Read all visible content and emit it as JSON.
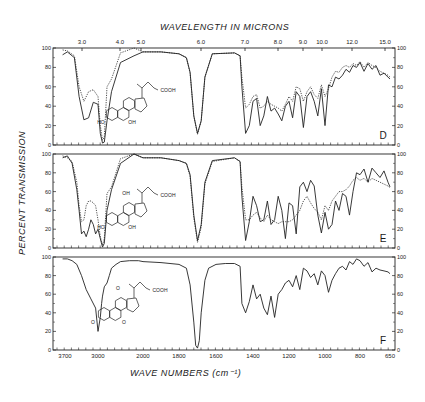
{
  "figure": {
    "top_axis_title": "WAVELENGTH IN MICRONS",
    "bottom_axis_title": "WAVE NUMBERS (cm⁻¹)",
    "y_axis_title": "PERCENT TRANSMISSION"
  },
  "chart_data": {
    "type": "line",
    "xlabel": "WAVE NUMBERS (cm-1)",
    "x2label": "WAVELENGTH IN MICRONS",
    "ylabel": "PERCENT TRANSMISSION",
    "top_ticks": [
      "3.0",
      "4.0",
      "5.0",
      "6.0",
      "7.0",
      "8.0",
      "9.0",
      "10.0",
      "12.0",
      "15.0"
    ],
    "top_tick_x": [
      82,
      120,
      141,
      201,
      245,
      278,
      303,
      322,
      352,
      385
    ],
    "bottom_ticks": [
      "3700",
      "3000",
      "2000",
      "1800",
      "1600",
      "1400",
      "1200",
      "1000",
      "800",
      "650"
    ],
    "bottom_tick_wn": [
      3700,
      3000,
      2000,
      1800,
      1600,
      1400,
      1200,
      1000,
      800,
      650
    ],
    "bottom_tick_x": [
      65,
      98,
      143,
      179,
      216,
      253,
      289,
      325,
      360,
      390
    ],
    "y_ticks": [
      0,
      20,
      40,
      60,
      80,
      100
    ],
    "ylim": [
      0,
      100
    ],
    "grid": false,
    "panels": [
      {
        "label": "D",
        "molecule_substituents": [
          "HO",
          "OH",
          "COOH"
        ],
        "series": [
          {
            "name": "solid",
            "style": "solid",
            "x": [
              3750,
              3650,
              3500,
              3400,
              3300,
              3200,
              3100,
              3000,
              2950,
              2900,
              2860,
              2800,
              2700,
              2500,
              2200,
              2000,
              1900,
              1800,
              1760,
              1740,
              1720,
              1700,
              1680,
              1660,
              1620,
              1500,
              1470,
              1460,
              1440,
              1420,
              1400,
              1380,
              1360,
              1340,
              1320,
              1300,
              1280,
              1260,
              1240,
              1220,
              1200,
              1180,
              1160,
              1140,
              1120,
              1100,
              1080,
              1060,
              1040,
              1020,
              1000,
              980,
              960,
              940,
              920,
              900,
              880,
              860,
              840,
              820,
              800,
              780,
              760,
              740,
              720,
              700,
              680,
              660,
              650
            ],
            "y": [
              93,
              96,
              90,
              50,
              26,
              28,
              44,
              42,
              12,
              2,
              3,
              25,
              55,
              85,
              92,
              96,
              96,
              94,
              90,
              75,
              30,
              12,
              25,
              70,
              94,
              95,
              92,
              60,
              12,
              20,
              45,
              48,
              20,
              30,
              50,
              35,
              38,
              32,
              25,
              40,
              45,
              28,
              55,
              50,
              18,
              50,
              55,
              45,
              30,
              58,
              20,
              62,
              60,
              70,
              68,
              72,
              78,
              75,
              82,
              80,
              85,
              76,
              84,
              78,
              82,
              72,
              74,
              70,
              68
            ]
          },
          {
            "name": "dotted",
            "style": "dotted",
            "x": [
              3750,
              3650,
              3500,
              3400,
              3300,
              3200,
              3100,
              3000,
              2950,
              2900,
              2860,
              2800,
              2700,
              2500,
              2200,
              2000,
              1900,
              1800,
              1760,
              1740,
              1720,
              1700,
              1680,
              1660,
              1620,
              1500,
              1470,
              1460,
              1440,
              1420,
              1400,
              1380,
              1360,
              1340,
              1320,
              1300,
              1280,
              1260,
              1240,
              1220,
              1200,
              1180,
              1160,
              1140,
              1120,
              1100,
              1080,
              1060,
              1040,
              1020,
              1000,
              980,
              960,
              940,
              920,
              900,
              880,
              860,
              840,
              820,
              800,
              780,
              760,
              740,
              720,
              700,
              680,
              660,
              650
            ],
            "y": [
              98,
              97,
              92,
              60,
              45,
              55,
              57,
              50,
              20,
              5,
              8,
              60,
              68,
              95,
              100,
              96,
              96,
              94,
              90,
              74,
              30,
              11,
              25,
              70,
              94,
              95,
              92,
              70,
              38,
              42,
              50,
              52,
              38,
              40,
              45,
              42,
              40,
              38,
              35,
              42,
              50,
              45,
              60,
              58,
              45,
              55,
              60,
              52,
              48,
              62,
              50,
              58,
              70,
              76,
              75,
              80,
              82,
              80,
              84,
              82,
              86,
              80,
              85,
              82,
              80,
              76,
              74,
              72,
              70
            ]
          }
        ]
      },
      {
        "label": "E",
        "molecule_substituents": [
          "HO",
          "OH",
          "OH",
          "COOH"
        ],
        "series": [
          {
            "name": "solid",
            "style": "solid",
            "x": [
              3750,
              3650,
              3550,
              3450,
              3400,
              3350,
              3300,
              3250,
              3200,
              3150,
              3100,
              3050,
              3000,
              2950,
              2900,
              2860,
              2800,
              2700,
              2500,
              2200,
              2000,
              1900,
              1800,
              1760,
              1740,
              1720,
              1700,
              1680,
              1660,
              1620,
              1500,
              1470,
              1460,
              1440,
              1420,
              1400,
              1380,
              1360,
              1340,
              1320,
              1300,
              1280,
              1260,
              1240,
              1220,
              1200,
              1180,
              1160,
              1140,
              1120,
              1100,
              1080,
              1060,
              1040,
              1020,
              1000,
              980,
              960,
              940,
              920,
              900,
              880,
              860,
              840,
              820,
              800,
              780,
              760,
              740,
              720,
              700,
              680,
              660,
              650
            ],
            "y": [
              96,
              98,
              90,
              62,
              40,
              15,
              18,
              12,
              20,
              30,
              25,
              15,
              20,
              10,
              1,
              5,
              40,
              62,
              90,
              100,
              96,
              96,
              93,
              90,
              78,
              35,
              8,
              25,
              70,
              93,
              96,
              92,
              55,
              8,
              28,
              55,
              45,
              28,
              30,
              50,
              25,
              30,
              55,
              40,
              10,
              48,
              45,
              15,
              65,
              70,
              60,
              72,
              66,
              35,
              16,
              38,
              20,
              25,
              50,
              40,
              58,
              55,
              35,
              60,
              80,
              78,
              84,
              70,
              85,
              80,
              75,
              82,
              70,
              65
            ]
          },
          {
            "name": "dotted",
            "style": "dotted",
            "x": [
              3750,
              3650,
              3550,
              3450,
              3400,
              3350,
              3300,
              3250,
              3200,
              3150,
              3100,
              3050,
              3000,
              2950,
              2900,
              2860,
              2800,
              2700,
              2500,
              2200,
              2000,
              1900,
              1800,
              1760,
              1740,
              1720,
              1700,
              1680,
              1660,
              1620,
              1500,
              1470,
              1460,
              1440,
              1420,
              1400,
              1380,
              1360,
              1340,
              1320,
              1300,
              1280,
              1260,
              1240,
              1220,
              1200,
              1180,
              1160,
              1140,
              1120,
              1100,
              1080,
              1060,
              1040,
              1020,
              1000,
              980,
              960,
              940,
              920,
              900,
              880,
              860,
              840,
              820,
              800,
              780,
              760,
              740,
              720,
              700,
              680,
              660,
              650
            ],
            "y": [
              98,
              96,
              92,
              70,
              45,
              28,
              30,
              45,
              50,
              50,
              48,
              45,
              30,
              12,
              3,
              10,
              58,
              65,
              95,
              100,
              96,
              96,
              93,
              90,
              76,
              32,
              6,
              22,
              68,
              92,
              96,
              92,
              65,
              30,
              30,
              35,
              38,
              32,
              28,
              35,
              30,
              28,
              26,
              28,
              28,
              28,
              30,
              35,
              40,
              50,
              55,
              48,
              42,
              38,
              30,
              45,
              40,
              50,
              55,
              60,
              60,
              62,
              66,
              72,
              75,
              72,
              74,
              70,
              74,
              72,
              70,
              68,
              66,
              64
            ]
          }
        ]
      },
      {
        "label": "F",
        "molecule_substituents": [
          "O",
          "O",
          "O",
          "COOH"
        ],
        "series": [
          {
            "name": "solid",
            "style": "solid",
            "x": [
              3750,
              3650,
              3550,
              3450,
              3350,
              3250,
              3150,
              3050,
              3000,
              2950,
              2920,
              2900,
              2860,
              2800,
              2750,
              2700,
              2600,
              2500,
              2300,
              2100,
              2000,
              1900,
              1800,
              1760,
              1740,
              1720,
              1710,
              1700,
              1690,
              1680,
              1660,
              1640,
              1600,
              1550,
              1500,
              1470,
              1460,
              1440,
              1420,
              1400,
              1380,
              1360,
              1340,
              1320,
              1300,
              1280,
              1260,
              1240,
              1220,
              1200,
              1180,
              1160,
              1140,
              1120,
              1100,
              1080,
              1060,
              1040,
              1020,
              1000,
              980,
              960,
              940,
              920,
              900,
              880,
              860,
              840,
              820,
              800,
              780,
              760,
              740,
              720,
              700,
              680,
              660,
              650
            ],
            "y": [
              98,
              98,
              96,
              92,
              80,
              65,
              55,
              45,
              20,
              35,
              50,
              58,
              68,
              72,
              80,
              88,
              92,
              95,
              96,
              96,
              95,
              94,
              92,
              88,
              70,
              30,
              5,
              2,
              10,
              40,
              75,
              88,
              92,
              93,
              93,
              90,
              50,
              40,
              52,
              70,
              55,
              60,
              45,
              38,
              58,
              35,
              60,
              65,
              72,
              75,
              68,
              80,
              65,
              88,
              85,
              78,
              82,
              70,
              85,
              80,
              62,
              75,
              82,
              88,
              90,
              86,
              95,
              92,
              98,
              96,
              90,
              94,
              84,
              88,
              86,
              85,
              84,
              82
            ]
          }
        ]
      }
    ]
  }
}
